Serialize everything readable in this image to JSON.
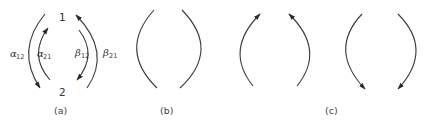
{
  "diagram": {
    "panels": [
      {
        "caption": "(a)",
        "nodes": [
          {
            "id": "1",
            "label": "1"
          },
          {
            "id": "2",
            "label": "2"
          }
        ],
        "arrows": [
          {
            "name": "alpha12",
            "symbol": "α",
            "subscript": "12",
            "side": "left",
            "ring": "outer",
            "direction": "1→2"
          },
          {
            "name": "alpha21",
            "symbol": "α",
            "subscript": "21",
            "side": "left",
            "ring": "inner",
            "direction": "2→1"
          },
          {
            "name": "beta12",
            "symbol": "β",
            "subscript": "12",
            "side": "right",
            "ring": "inner",
            "direction": "1→2"
          },
          {
            "name": "beta21",
            "symbol": "β",
            "subscript": "21",
            "side": "right",
            "ring": "outer",
            "direction": "2→1"
          }
        ]
      },
      {
        "caption": "(b)",
        "arrows": [
          {
            "side": "left",
            "arrowhead": "none"
          },
          {
            "side": "right",
            "arrowhead": "none"
          }
        ]
      },
      {
        "caption": "(c)",
        "groups": [
          {
            "arrows": [
              {
                "side": "left",
                "arrowhead": "top"
              },
              {
                "side": "right",
                "arrowhead": "top"
              }
            ]
          },
          {
            "arrows": [
              {
                "side": "left",
                "arrowhead": "bottom"
              },
              {
                "side": "right",
                "arrowhead": "bottom"
              }
            ]
          }
        ]
      }
    ]
  },
  "colors": {
    "stroke": "#3a3a3a",
    "text": "#333333"
  }
}
